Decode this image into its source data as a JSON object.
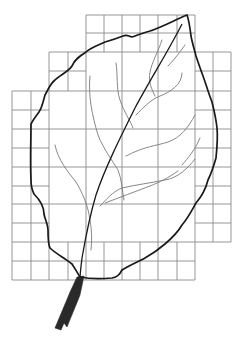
{
  "figure": {
    "colors": {
      "background": "#ffffff",
      "grid": "#8a8a8a",
      "outline": "#1a1a1a",
      "veins": "#7a7a7a",
      "stem": "#2a2a2a"
    },
    "grid": {
      "small_cell_px": 18.3,
      "large_cell_px": 36.6,
      "x_min": 12,
      "x_max": 231,
      "y_min": 15,
      "y_max": 280
    }
  }
}
